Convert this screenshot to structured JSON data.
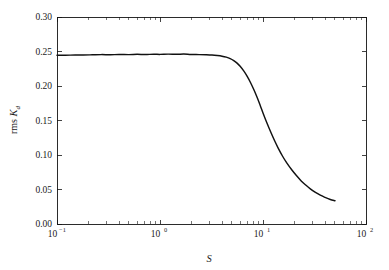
{
  "figure": {
    "background_color": "#ffffff",
    "frame_color": "#141414",
    "curve_color": "#111111"
  },
  "chart_data": {
    "type": "line",
    "title": "",
    "subtitle": "",
    "xlabel": "S",
    "ylabel": "rms K_d",
    "ylabel_main": "rms ",
    "ylabel_symbol": "K",
    "ylabel_subscript": "d",
    "xscale": "log",
    "yscale": "linear",
    "xlim": [
      0.1,
      100
    ],
    "ylim": [
      0.0,
      0.3
    ],
    "grid": false,
    "legend": null,
    "legend_position": "none",
    "xticks": [
      0.1,
      1,
      10,
      100
    ],
    "xtick_labels": [
      "10⁻¹",
      "10⁰",
      "10¹",
      "10²"
    ],
    "xtick_mantissas": [
      "10",
      "10",
      "10",
      "10"
    ],
    "xtick_exponents": [
      "-1",
      "0",
      "1",
      "2"
    ],
    "yticks": [
      0.0,
      0.05,
      0.1,
      0.15,
      0.2,
      0.25,
      0.3
    ],
    "ytick_labels": [
      "0.00",
      "0.05",
      "0.10",
      "0.15",
      "0.20",
      "0.25",
      "0.30"
    ],
    "xminor_ticks": [
      0.2,
      0.3,
      0.4,
      0.5,
      0.6,
      0.7,
      0.8,
      0.9,
      2,
      3,
      4,
      5,
      6,
      7,
      8,
      9,
      20,
      30,
      40,
      50,
      60,
      70,
      80,
      90
    ],
    "series": [
      {
        "name": "rms Kd",
        "x": [
          0.1,
          0.12,
          0.15,
          0.18,
          0.22,
          0.27,
          0.33,
          0.4,
          0.5,
          0.6,
          0.72,
          0.87,
          1.0,
          1.2,
          1.45,
          1.7,
          2.0,
          2.4,
          2.8,
          3.2,
          3.6,
          4.0,
          4.4,
          4.8,
          5.2,
          5.6,
          6.0,
          6.5,
          7.0,
          7.6,
          8.2,
          8.8,
          9.4,
          10.0,
          11.0,
          12.0,
          13.0,
          14.0,
          15.5,
          17.0,
          19.0,
          21.0,
          23.5,
          26.0,
          29.0,
          32.0,
          36.0,
          40.0,
          45.0,
          50.0
        ],
        "y": [
          0.2445,
          0.2447,
          0.2448,
          0.2449,
          0.2452,
          0.2455,
          0.2453,
          0.2457,
          0.2455,
          0.2459,
          0.2456,
          0.2461,
          0.2458,
          0.2462,
          0.2459,
          0.2463,
          0.2457,
          0.2455,
          0.2452,
          0.2448,
          0.2441,
          0.2432,
          0.2418,
          0.2398,
          0.2369,
          0.2332,
          0.2285,
          0.2218,
          0.2142,
          0.2044,
          0.1938,
          0.1829,
          0.1718,
          0.161,
          0.1452,
          0.1318,
          0.1202,
          0.1104,
          0.0982,
          0.0886,
          0.0786,
          0.0706,
          0.0625,
          0.0564,
          0.0505,
          0.0461,
          0.0417,
          0.0386,
          0.0356,
          0.0338
        ]
      }
    ]
  }
}
